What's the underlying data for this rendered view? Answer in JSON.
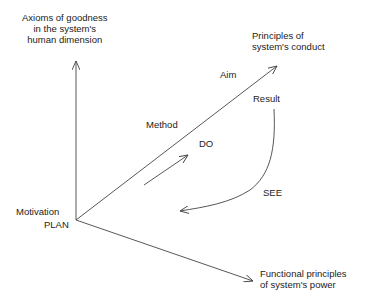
{
  "diagram": {
    "axes": {
      "vertical": {
        "label_lines": [
          "Axioms of goodness",
          "in the system's",
          "human dimension"
        ]
      },
      "diagonal": {
        "label_lines": [
          "Principles of",
          "system's conduct"
        ]
      },
      "horizontal": {
        "label_lines": [
          "Functional principles",
          "of system's power"
        ]
      }
    },
    "labels": {
      "aim": "Aim",
      "result": "Result",
      "method": "Method",
      "do": "DO",
      "see": "SEE",
      "motivation": "Motivation",
      "plan": "PLAN"
    },
    "colors": {
      "stroke": "#444444",
      "text": "#222222",
      "background": "#ffffff"
    }
  }
}
